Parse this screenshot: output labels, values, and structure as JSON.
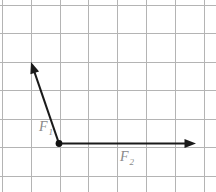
{
  "figure": {
    "background_color": "#ffffff",
    "width": 216,
    "height": 192
  },
  "grid": {
    "line_color": "#b4b4b4",
    "cell_size": 28.6,
    "vertical_x": [
      2,
      31,
      60,
      88,
      117,
      146,
      175,
      204
    ],
    "horizontal_y": [
      5,
      33,
      62,
      90,
      119,
      147,
      176
    ]
  },
  "origin": {
    "label": "origin-point",
    "x": 59,
    "y": 143.5,
    "radius": 3.4,
    "color": "#111111"
  },
  "chart_data": {
    "type": "scatter",
    "xlabel": "",
    "ylabel": "",
    "grid": true,
    "legend": "none",
    "xlim": [
      -2,
      5.5
    ],
    "ylim": [
      -1,
      5
    ],
    "vectors": [
      {
        "name": "F1",
        "label": "F",
        "subscript": "1",
        "origin_px": [
          59,
          143.5
        ],
        "tip_px": [
          31,
          62
        ],
        "components_cells": [
          -1,
          2.85
        ],
        "magnitude_cells": 3.02,
        "angle_deg": 109.1,
        "color": "#1a1a1a"
      },
      {
        "name": "F2",
        "label": "F",
        "subscript": "2",
        "origin_px": [
          59,
          143.5
        ],
        "tip_px": [
          196,
          143.5
        ],
        "components_cells": [
          4.79,
          0
        ],
        "magnitude_cells": 4.79,
        "angle_deg": 0,
        "color": "#1a1a1a"
      }
    ]
  },
  "labels": {
    "f1": {
      "text": "F",
      "subscript": "1",
      "x": 39,
      "y": 131,
      "color": "#8a8a8a"
    },
    "f2": {
      "text": "F",
      "subscript": "2",
      "x": 120,
      "y": 161,
      "color": "#8a8a8a"
    }
  }
}
